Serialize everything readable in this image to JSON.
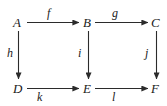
{
  "diagram": {
    "kind": "commutative-diagram",
    "background_color": "#ffffff",
    "stroke_color": "#2b2b2b",
    "text_color": "#1a1a1a",
    "objects": [
      {
        "id": "A",
        "label": "A",
        "row": 0,
        "col": 0
      },
      {
        "id": "B",
        "label": "B",
        "row": 0,
        "col": 1
      },
      {
        "id": "C",
        "label": "C",
        "row": 0,
        "col": 2
      },
      {
        "id": "D",
        "label": "D",
        "row": 1,
        "col": 0
      },
      {
        "id": "E",
        "label": "E",
        "row": 1,
        "col": 1
      },
      {
        "id": "F",
        "label": "F",
        "row": 1,
        "col": 2
      }
    ],
    "morphisms": [
      {
        "id": "f",
        "label": "f",
        "from": "A",
        "to": "B",
        "direction": "right"
      },
      {
        "id": "g",
        "label": "g",
        "from": "B",
        "to": "C",
        "direction": "right"
      },
      {
        "id": "h",
        "label": "h",
        "from": "A",
        "to": "D",
        "direction": "down"
      },
      {
        "id": "i",
        "label": "i",
        "from": "B",
        "to": "E",
        "direction": "down"
      },
      {
        "id": "j",
        "label": "j",
        "from": "C",
        "to": "F",
        "direction": "down"
      },
      {
        "id": "k",
        "label": "k",
        "from": "D",
        "to": "E",
        "direction": "right"
      },
      {
        "id": "l",
        "label": "l",
        "from": "E",
        "to": "F",
        "direction": "right"
      }
    ]
  }
}
